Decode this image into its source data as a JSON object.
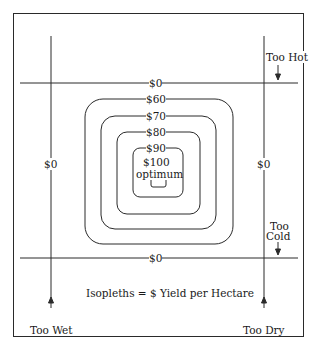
{
  "diagram": {
    "caption": "Isopleths = $ Yield per Hectare",
    "limits": {
      "too_hot": "Too Hot",
      "too_cold_line1": "Too",
      "too_cold_line2": "Cold",
      "too_wet": "Too Wet",
      "too_dry": "Too Dry"
    },
    "boundary_labels": {
      "top": "$0",
      "bottom": "$0",
      "left": "$0",
      "right": "$0"
    },
    "isopleths": [
      {
        "label": "$60"
      },
      {
        "label": "$70"
      },
      {
        "label": "$80"
      },
      {
        "label": "$90"
      }
    ],
    "center": {
      "value": "$100",
      "note": "optimum"
    }
  }
}
